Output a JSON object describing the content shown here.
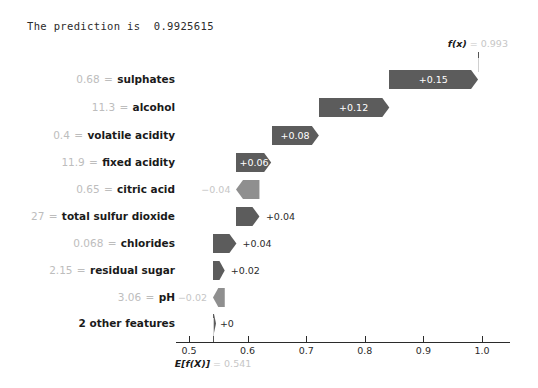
{
  "title": "The prediction is  0.9925615",
  "chart_data": {
    "type": "bar",
    "chart_kind": "shap-waterfall",
    "title": "The prediction is  0.9925615",
    "xlabel": "",
    "ylabel": "",
    "xlim": [
      0.4655,
      1.0322
    ],
    "grid": false,
    "base_value": {
      "symbol": "E[f(X)]",
      "value": "0.541",
      "numeric": 0.541
    },
    "output_value": {
      "symbol": "f(x)",
      "value": "0.993",
      "numeric": 0.993
    },
    "xticks": [
      0.5,
      0.6,
      0.7,
      0.8,
      0.9,
      1.0
    ],
    "xticklabels": [
      "0.5",
      "0.6",
      "0.7",
      "0.8",
      "0.9",
      "1.0"
    ],
    "colors": {
      "positive_bar": "#5c5c5c",
      "negative_bar": "#8f8f8f",
      "positive_text": "#2b2b2b",
      "negative_text": "#c6c6c6",
      "feature_name": "#1a1a1a",
      "feature_value": "#bdbdbd",
      "axis": "#2b2b2b"
    },
    "rows": [
      {
        "feature": "sulphates",
        "value": "0.68",
        "shap_label": "+0.15",
        "shap": 0.15,
        "start": 0.841,
        "end": 0.993,
        "direction": "positive",
        "label_position": "inside"
      },
      {
        "feature": "alcohol",
        "value": "11.3",
        "shap_label": "+0.12",
        "shap": 0.12,
        "start": 0.721,
        "end": 0.841,
        "direction": "positive",
        "label_position": "inside"
      },
      {
        "feature": "volatile acidity",
        "value": "0.4",
        "shap_label": "+0.08",
        "shap": 0.08,
        "start": 0.641,
        "end": 0.721,
        "direction": "positive",
        "label_position": "inside"
      },
      {
        "feature": "fixed acidity",
        "value": "11.9",
        "shap_label": "+0.06",
        "shap": 0.06,
        "start": 0.581,
        "end": 0.641,
        "direction": "positive",
        "label_position": "inside"
      },
      {
        "feature": "citric acid",
        "value": "0.65",
        "shap_label": "−0.04",
        "shap": -0.04,
        "start": 0.621,
        "end": 0.581,
        "direction": "negative",
        "label_position": "outside-left"
      },
      {
        "feature": "total sulfur dioxide",
        "value": "27",
        "shap_label": "+0.04",
        "shap": 0.04,
        "start": 0.581,
        "end": 0.621,
        "direction": "positive",
        "label_position": "outside-right"
      },
      {
        "feature": "chlorides",
        "value": "0.068",
        "shap_label": "+0.04",
        "shap": 0.04,
        "start": 0.541,
        "end": 0.581,
        "direction": "positive",
        "label_position": "outside-right"
      },
      {
        "feature": "residual sugar",
        "value": "2.15",
        "shap_label": "+0.02",
        "shap": 0.02,
        "start": 0.541,
        "end": 0.561,
        "direction": "positive",
        "label_position": "outside-right"
      },
      {
        "feature": "pH",
        "value": "3.06",
        "shap_label": "−0.02",
        "shap": -0.02,
        "start": 0.561,
        "end": 0.541,
        "direction": "negative",
        "label_position": "outside-left"
      },
      {
        "feature": "2 other features",
        "value": null,
        "shap_label": "+0",
        "shap": 0.0,
        "start": 0.541,
        "end": 0.5425,
        "direction": "positive",
        "label_position": "outside-right"
      }
    ]
  }
}
